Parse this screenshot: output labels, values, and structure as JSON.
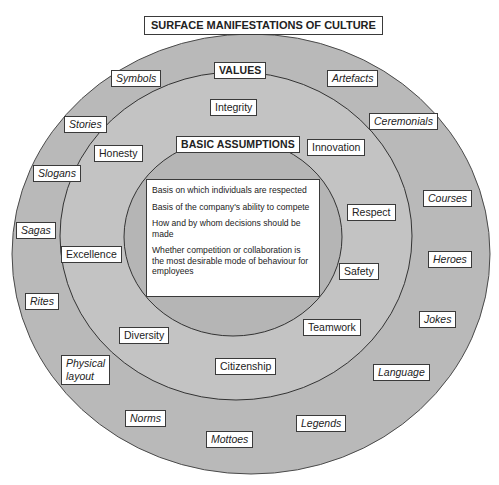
{
  "title": "SURFACE MANIFESTATIONS OF CULTURE",
  "colors": {
    "outer_ring": "#b9b9b9",
    "middle_ring": "#c4c4c4",
    "inner_ring": "#b4b4b4",
    "ring_stroke": "#4a4a4a",
    "label_bg": "#ffffff",
    "label_border": "#3a3a3a"
  },
  "layers": {
    "surface": {
      "items": [
        "Symbols",
        "Artefacts",
        "Stories",
        "Ceremonials",
        "Slogans",
        "Courses",
        "Sagas",
        "Heroes",
        "Rites",
        "Jokes",
        "Physical\nlayout",
        "Language",
        "Norms",
        "Legends",
        "Mottoes"
      ]
    },
    "values": {
      "heading": "VALUES",
      "items": [
        "Integrity",
        "Honesty",
        "Innovation",
        "Respect",
        "Excellence",
        "Safety",
        "Diversity",
        "Teamwork",
        "Citizenship"
      ]
    },
    "basic_assumptions": {
      "heading": "BASIC ASSUMPTIONS",
      "items": [
        "Basis on which individuals are respected",
        "Basis of the company's ability to compete",
        "How and by whom decisions should be made",
        "Whether competition or collaboration is the most desirable mode of behaviour for employees"
      ]
    }
  }
}
